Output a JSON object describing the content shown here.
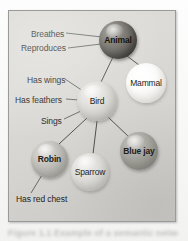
{
  "figure": {
    "frame_border_color": "#9a9a97",
    "frame_background_color": "#d7d6d2",
    "caption_text": "Figure 1.1 Example of a semantic network",
    "nodes": [
      {
        "id": "animal",
        "label": "Animal",
        "fill": "#5e5b55",
        "shade": "dark",
        "cx": 109,
        "cy": 29,
        "r": 19
      },
      {
        "id": "mammal",
        "label": "Mammal",
        "fill": "#fcfcfb",
        "shade": "near-white",
        "cx": 137,
        "cy": 72,
        "r": 20
      },
      {
        "id": "bird",
        "label": "Bird",
        "fill": "#d0cfca",
        "shade": "light",
        "cx": 88,
        "cy": 90,
        "r": 20
      },
      {
        "id": "robin",
        "label": "Robin",
        "fill": "#b3b2ad",
        "shade": "medium",
        "cx": 40,
        "cy": 148,
        "r": 18
      },
      {
        "id": "sparrow",
        "label": "Sparrow",
        "fill": "#d7d6d2",
        "shade": "light",
        "cx": 81,
        "cy": 161,
        "r": 19
      },
      {
        "id": "bluejay",
        "label": "Blue jay",
        "fill": "#98978f",
        "shade": "medium-dark",
        "cx": 130,
        "cy": 140,
        "r": 19
      }
    ],
    "property_labels": [
      {
        "id": "breathes",
        "text": "Breathes",
        "attached_to": "animal"
      },
      {
        "id": "reproduces",
        "text": "Reproduces",
        "attached_to": "animal"
      },
      {
        "id": "has-wings",
        "text": "Has wings",
        "attached_to": "bird"
      },
      {
        "id": "has-feathers",
        "text": "Has feathers",
        "attached_to": "bird"
      },
      {
        "id": "sings",
        "text": "Sings",
        "attached_to": "bird"
      },
      {
        "id": "has-red-chest",
        "text": "Has red chest",
        "attached_to": "robin"
      }
    ],
    "links": [
      {
        "from": "animal",
        "to": "bird"
      },
      {
        "from": "animal",
        "to": "mammal"
      },
      {
        "from": "bird",
        "to": "robin"
      },
      {
        "from": "bird",
        "to": "sparrow"
      },
      {
        "from": "bird",
        "to": "bluejay"
      }
    ]
  }
}
